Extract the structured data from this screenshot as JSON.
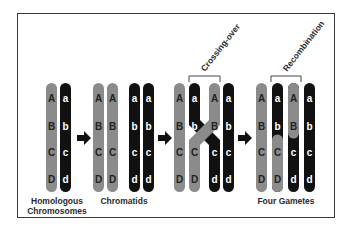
{
  "colors": {
    "grey_chromosome": "#8b8b8b",
    "black_chromosome": "#111111",
    "uppercase_letter": "#222222",
    "lowercase_letter": "#ffffff",
    "border": "#3a3a3a",
    "arrow": "#111111"
  },
  "stages": [
    {
      "label_line1": "Homologous",
      "label_line2": "Chromosomes",
      "chromosomes": [
        {
          "color": "grey",
          "genes": [
            "A",
            "B",
            "C",
            "D"
          ]
        },
        {
          "color": "black",
          "genes": [
            "a",
            "b",
            "c",
            "d"
          ]
        }
      ]
    },
    {
      "label_line1": "Chromatids",
      "chromosomes": [
        {
          "color": "grey",
          "genes": [
            "A",
            "B",
            "C",
            "D"
          ]
        },
        {
          "color": "grey",
          "genes": [
            "A",
            "B",
            "C",
            "D"
          ]
        },
        {
          "color": "black",
          "genes": [
            "a",
            "b",
            "c",
            "d"
          ]
        },
        {
          "color": "black",
          "genes": [
            "a",
            "b",
            "c",
            "d"
          ]
        }
      ]
    },
    {
      "annotation": "Crossing-over",
      "chromosomes": [
        {
          "color": "grey",
          "genes": [
            "A",
            "B",
            "C",
            "D"
          ]
        },
        {
          "color": "black-crossing",
          "genes": [
            "a",
            "b",
            "C",
            "D"
          ]
        },
        {
          "color": "grey-crossing",
          "genes": [
            "A",
            "B",
            "c",
            "d"
          ]
        },
        {
          "color": "black",
          "genes": [
            "a",
            "b",
            "c",
            "d"
          ]
        }
      ]
    },
    {
      "annotation": "Recombination",
      "label_line1": "Four Gametes",
      "chromosomes": [
        {
          "color": "grey",
          "genes": [
            "A",
            "B",
            "C",
            "D"
          ]
        },
        {
          "color": "black-top/grey-bottom",
          "genes": [
            "a",
            "b",
            "C",
            "D"
          ]
        },
        {
          "color": "grey-top/black-bottom",
          "genes": [
            "A",
            "B",
            "c",
            "d"
          ]
        },
        {
          "color": "black",
          "genes": [
            "a",
            "b",
            "c",
            "d"
          ]
        }
      ]
    }
  ],
  "labels": {
    "homologous_1": "Homologous",
    "homologous_2": "Chromosomes",
    "chromatids": "Chromatids",
    "crossing_over": "Crossing-over",
    "recombination": "Recombination",
    "four_gametes": "Four Gametes"
  },
  "icons": [
    "arrow-right-icon",
    "arrow-right-icon",
    "arrow-right-icon"
  ]
}
